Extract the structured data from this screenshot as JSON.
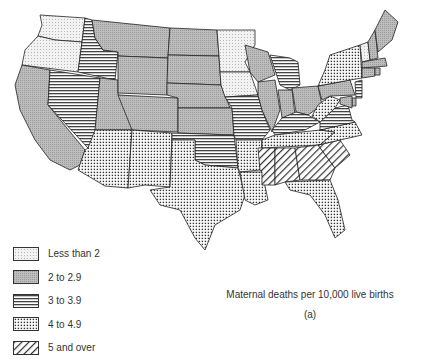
{
  "caption": "Maternal deaths per 10,000 live births",
  "sublabel": "(a)",
  "legend": [
    {
      "key": "c1",
      "label": "Less than 2",
      "pattern": "fine-dots"
    },
    {
      "key": "c2",
      "label": "2 to 2.9",
      "pattern": "gray-stipple"
    },
    {
      "key": "c3",
      "label": "3 to 3.9",
      "pattern": "horizontal-lines"
    },
    {
      "key": "c4",
      "label": "4 to 4.9",
      "pattern": "dot-grid"
    },
    {
      "key": "c5",
      "label": "5 and over",
      "pattern": "diagonal-hatch"
    }
  ],
  "states": {
    "WA": "c1",
    "OR": "c1",
    "CA": "c2",
    "ID": "c3",
    "NV": "c3",
    "UT": "c2",
    "AZ": "c4",
    "MT": "c2",
    "WY": "c2",
    "CO": "c2",
    "NM": "c4",
    "ND": "c2",
    "SD": "c2",
    "NE": "c2",
    "KS": "c2",
    "OK": "c3",
    "TX": "c4",
    "MN": "c1",
    "IA": "c1",
    "MO": "c3",
    "AR": "c4",
    "LA": "c4",
    "WI": "c2",
    "IL": "c2",
    "MI": "c3",
    "IN": "c2",
    "OH": "c2",
    "KY": "c3",
    "TN": "c4",
    "MS": "c5",
    "AL": "c5",
    "GA": "c5",
    "FL": "c4",
    "SC": "c5",
    "NC": "c4",
    "VA": "c3",
    "WV": "c4",
    "PA": "c2",
    "NY": "c4",
    "VT": "c1",
    "NH": "c2",
    "ME": "c2",
    "MA": "c2",
    "CT": "c2",
    "RI": "c2",
    "NJ": "c3",
    "DE": "c2",
    "MD": "c2"
  }
}
